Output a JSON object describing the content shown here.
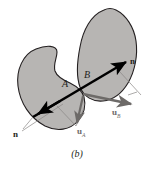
{
  "figure": {
    "caption": "(b)",
    "background_color": "#ffffff",
    "body_fill_color": "#b7b5b3",
    "body_stroke_color": "#231f20",
    "normal_line_color": "#000000",
    "tangent_vector_color": "#6d6a68",
    "labels": {
      "point_a": "A",
      "point_b": "B",
      "normal_left": "n",
      "normal_right": "n",
      "u_a_base": "u",
      "u_a_sub": "A",
      "u_b_base": "u",
      "u_b_sub": "B"
    },
    "elements": {
      "body_a_name": "body-a-blob",
      "body_b_name": "body-b-blob",
      "normal_axis_name": "normal-axis-double-arrow",
      "u_a_arrow_name": "velocity-vector-u-a",
      "u_b_arrow_name": "velocity-vector-u-b",
      "tangent_line_name": "tangent-construction-line"
    }
  }
}
